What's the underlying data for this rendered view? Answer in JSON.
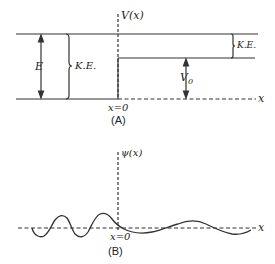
{
  "panel_a": {
    "caption": "(A)",
    "axis_label_y": "V(x)",
    "axis_label_x": "x",
    "origin_label": "x=0",
    "energy_label": "E",
    "ke_left_label": "K.E.",
    "ke_right_label": "K.E.",
    "step_label": "V",
    "step_subscript": "0"
  },
  "panel_b": {
    "caption": "(B)",
    "axis_label_y": "ψ(x)",
    "axis_label_x": "x",
    "origin_label": "x=0"
  },
  "colors": {
    "line": "#333333",
    "background": "#ffffff"
  }
}
